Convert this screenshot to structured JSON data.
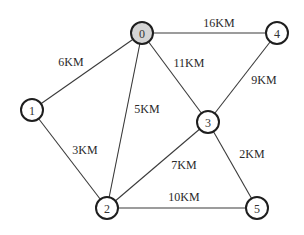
{
  "graph": {
    "nodes": [
      {
        "id": "0",
        "label": "0",
        "x": 142,
        "y": 33,
        "highlighted": true
      },
      {
        "id": "1",
        "label": "1",
        "x": 32,
        "y": 110,
        "highlighted": false
      },
      {
        "id": "2",
        "label": "2",
        "x": 107,
        "y": 208,
        "highlighted": false
      },
      {
        "id": "3",
        "label": "3",
        "x": 208,
        "y": 122,
        "highlighted": false
      },
      {
        "id": "4",
        "label": "4",
        "x": 277,
        "y": 33,
        "highlighted": false
      },
      {
        "id": "5",
        "label": "5",
        "x": 257,
        "y": 208,
        "highlighted": false
      }
    ],
    "edges": [
      {
        "from": "0",
        "to": "1",
        "label": "6KM",
        "lx": 71,
        "ly": 62
      },
      {
        "from": "0",
        "to": "2",
        "label": "5KM",
        "lx": 147,
        "ly": 109
      },
      {
        "from": "0",
        "to": "4",
        "label": "16KM",
        "lx": 219,
        "ly": 23
      },
      {
        "from": "0",
        "to": "3",
        "label": "11KM",
        "lx": 189,
        "ly": 63
      },
      {
        "from": "4",
        "to": "3",
        "label": "9KM",
        "lx": 264,
        "ly": 80
      },
      {
        "from": "1",
        "to": "2",
        "label": "3KM",
        "lx": 85,
        "ly": 150
      },
      {
        "from": "3",
        "to": "2",
        "label": "7KM",
        "lx": 184,
        "ly": 165
      },
      {
        "from": "3",
        "to": "5",
        "label": "2KM",
        "lx": 252,
        "ly": 154
      },
      {
        "from": "2",
        "to": "5",
        "label": "10KM",
        "lx": 184,
        "ly": 197
      }
    ],
    "colors": {
      "highlight_fill": "#d4d4d4",
      "node_stroke": "#1e1e1e",
      "edge": "#3a3a3a"
    }
  }
}
